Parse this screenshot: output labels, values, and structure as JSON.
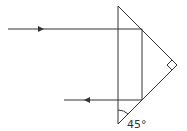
{
  "diagram": {
    "angle_label": "45°",
    "stroke_color": "#333333",
    "prism": {
      "vertices": [
        [
          118,
          6
        ],
        [
          177,
          65
        ],
        [
          118,
          124
        ]
      ],
      "right_angle_at": [
        177,
        65
      ]
    },
    "incident_ray": {
      "from": [
        8,
        29
      ],
      "to": [
        142,
        29
      ],
      "arrow_at": [
        41,
        29
      ],
      "direction": "right"
    },
    "internal_ray": {
      "from": [
        142,
        29
      ],
      "to": [
        142,
        100
      ]
    },
    "emergent_ray": {
      "from": [
        142,
        100
      ],
      "to": [
        64,
        100
      ],
      "arrow_at": [
        87,
        100
      ],
      "direction": "left"
    }
  }
}
